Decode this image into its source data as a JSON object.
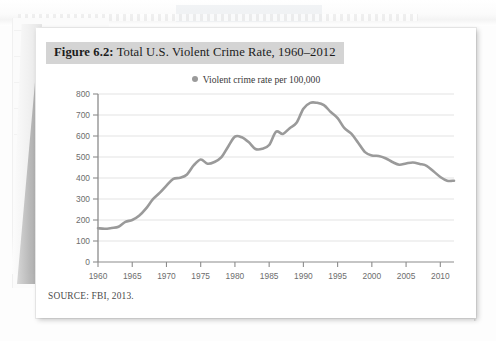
{
  "figure": {
    "number_label": "Figure 6.2:",
    "title": " Total U.S. Violent Crime Rate, 1960–2012",
    "legend_label": "Violent crime rate per 100,000",
    "legend_marker_color": "#9a9a9a",
    "source": "SOURCE: FBI, 2013.",
    "line_color": "#9a9a9a",
    "gridline_color": "#e3e3e3",
    "axis_color": "#8c8c8c",
    "title_band_color": "#d4d4d4"
  },
  "chart_data": {
    "type": "line",
    "title": "Figure 6.2: Total U.S. Violent Crime Rate, 1960–2012",
    "xlabel": "",
    "ylabel": "",
    "xlim": [
      1960,
      2012
    ],
    "ylim": [
      0,
      800
    ],
    "grid": true,
    "legend_position": "top-center",
    "ytick_labels": [
      "0",
      "100",
      "200",
      "300",
      "400",
      "500",
      "600",
      "700",
      "800"
    ],
    "yticks": [
      0,
      100,
      200,
      300,
      400,
      500,
      600,
      700,
      800
    ],
    "xtick_labels": [
      "1960",
      "1965",
      "1970",
      "1975",
      "1980",
      "1985",
      "1990",
      "1995",
      "2000",
      "2005",
      "2010"
    ],
    "xticks": [
      1960,
      1965,
      1970,
      1975,
      1980,
      1985,
      1990,
      1995,
      2000,
      2005,
      2010
    ],
    "series": [
      {
        "name": "Violent crime rate per 100,000",
        "color": "#9a9a9a",
        "x": [
          1960,
          1961,
          1962,
          1963,
          1964,
          1965,
          1966,
          1967,
          1968,
          1969,
          1970,
          1971,
          1972,
          1973,
          1974,
          1975,
          1976,
          1977,
          1978,
          1979,
          1980,
          1981,
          1982,
          1983,
          1984,
          1985,
          1986,
          1987,
          1988,
          1989,
          1990,
          1991,
          1992,
          1993,
          1994,
          1995,
          1996,
          1997,
          1998,
          1999,
          2000,
          2001,
          2002,
          2003,
          2004,
          2005,
          2006,
          2007,
          2008,
          2009,
          2010,
          2011,
          2012
        ],
        "values": [
          161,
          158,
          162,
          168,
          191,
          200,
          220,
          254,
          298,
          329,
          364,
          396,
          401,
          417,
          461,
          488,
          468,
          476,
          498,
          549,
          597,
          594,
          571,
          538,
          539,
          557,
          620,
          610,
          637,
          663,
          730,
          758,
          758,
          747,
          714,
          685,
          637,
          611,
          568,
          523,
          507,
          505,
          494,
          476,
          463,
          469,
          474,
          467,
          458,
          432,
          405,
          387,
          387
        ],
        "annotations": {
          "peak_year": 1991,
          "peak_value": 758,
          "start_value": 161,
          "end_value": 387
        }
      }
    ]
  }
}
